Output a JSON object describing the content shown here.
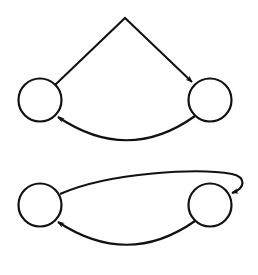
{
  "diagram": {
    "stroke_color": "#111111",
    "background": "#ffffff",
    "stroke_width": 2.2,
    "top_graph": {
      "nodes": [
        {
          "id": "A",
          "cx": 40,
          "cy": 100,
          "r": 21.5,
          "label": ""
        },
        {
          "id": "B",
          "cx": 210,
          "cy": 100,
          "r": 21.5,
          "label": ""
        }
      ],
      "edges": [
        {
          "from": "A",
          "to": "B",
          "shape": "angled",
          "path": "M 55 85 L 125 18 L 192 82",
          "arrow_at": [
            192,
            82
          ],
          "arrow_angle": 44
        },
        {
          "from": "B",
          "to": "A",
          "shape": "curve-below",
          "path": "M 195 116 Q 128 164 58 117",
          "arrow_at": [
            58,
            117
          ],
          "arrow_angle": 214
        }
      ]
    },
    "bottom_graph": {
      "nodes": [
        {
          "id": "C",
          "cx": 40,
          "cy": 205,
          "r": 21.5,
          "label": ""
        },
        {
          "id": "D",
          "cx": 210,
          "cy": 205,
          "r": 21.5,
          "label": ""
        }
      ],
      "edges": [
        {
          "from": "C",
          "to": "D",
          "shape": "curve-above-loop",
          "path": "M 60 194 C 110 172, 200 168, 232 174 C 246 177, 246 188, 232 193",
          "arrow_at": [
            232,
            193
          ],
          "arrow_angle": 155
        },
        {
          "from": "D",
          "to": "C",
          "shape": "curve-below",
          "path": "M 195 221 Q 128 268 58 222",
          "arrow_at": [
            58,
            222
          ],
          "arrow_angle": 214
        }
      ]
    }
  }
}
